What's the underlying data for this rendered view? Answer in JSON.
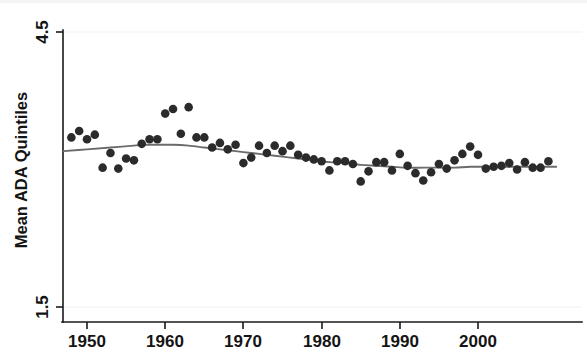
{
  "chart_data": {
    "type": "scatter",
    "title": "",
    "subtitle": "",
    "xlabel": "",
    "ylabel": "Mean ADA Quintiles",
    "xlim": [
      1947,
      2010
    ],
    "ylim": [
      1.5,
      4.5
    ],
    "xticks": [
      1950,
      1960,
      1970,
      1980,
      1990,
      2000
    ],
    "xtick_labels": [
      "1950",
      "1960",
      "1970",
      "1980",
      "1990",
      "2000"
    ],
    "yticks": [
      1.5,
      4.5
    ],
    "ytick_labels": [
      "1.5",
      "4.5"
    ],
    "grid": false,
    "legend": null,
    "annotations": [],
    "marker_color": "#2b2b2b",
    "fit_line_color": "#6b6b6b",
    "axis_color": "#1a1a1a",
    "background_color": "#ffffff",
    "series": [
      {
        "name": "Mean ADA Quintiles",
        "type": "scatter",
        "x": [
          1948,
          1949,
          1950,
          1951,
          1952,
          1953,
          1954,
          1955,
          1956,
          1957,
          1958,
          1959,
          1960,
          1961,
          1962,
          1963,
          1964,
          1965,
          1966,
          1967,
          1968,
          1969,
          1970,
          1971,
          1972,
          1973,
          1974,
          1975,
          1976,
          1977,
          1978,
          1979,
          1980,
          1981,
          1982,
          1983,
          1984,
          1985,
          1986,
          1987,
          1988,
          1989,
          1990,
          1991,
          1992,
          1993,
          1994,
          1995,
          1996,
          1997,
          1998,
          1999,
          2000,
          2001,
          2002,
          2003,
          2004,
          2005,
          2006,
          2007,
          2008,
          2009
        ],
        "y": [
          3.35,
          3.42,
          3.33,
          3.38,
          3.02,
          3.18,
          3.01,
          3.12,
          3.1,
          3.28,
          3.33,
          3.33,
          3.61,
          3.66,
          3.39,
          3.68,
          3.35,
          3.35,
          3.24,
          3.29,
          3.22,
          3.27,
          3.07,
          3.13,
          3.26,
          3.18,
          3.26,
          3.2,
          3.26,
          3.16,
          3.13,
          3.11,
          3.09,
          2.99,
          3.09,
          3.09,
          3.06,
          2.87,
          2.98,
          3.08,
          3.08,
          2.99,
          3.17,
          3.04,
          2.96,
          2.88,
          2.97,
          3.06,
          3.01,
          3.1,
          3.17,
          3.25,
          3.16,
          3.01,
          3.03,
          3.04,
          3.07,
          3.0,
          3.08,
          3.02,
          3.02,
          3.09
        ]
      },
      {
        "name": "Smoothed fit (lowess)",
        "type": "line",
        "x": [
          1947,
          1950,
          1953,
          1956,
          1957,
          1959,
          1961,
          1963,
          1965,
          1967,
          1969,
          1971,
          1973,
          1975,
          1977,
          1979,
          1981,
          1983,
          1985,
          1987,
          1989,
          1991,
          1993,
          1995,
          1997,
          1999,
          2001,
          2003,
          2005,
          2007,
          2009,
          2010
        ],
        "y": [
          3.2,
          3.22,
          3.24,
          3.26,
          3.27,
          3.27,
          3.27,
          3.26,
          3.24,
          3.22,
          3.2,
          3.18,
          3.16,
          3.14,
          3.12,
          3.1,
          3.08,
          3.07,
          3.05,
          3.04,
          3.03,
          3.02,
          3.02,
          3.02,
          3.02,
          3.03,
          3.03,
          3.03,
          3.03,
          3.03,
          3.03,
          3.03
        ]
      }
    ]
  },
  "axes": {
    "y_axis_title": "Mean ADA Quintiles",
    "y_tick_top": "4.5",
    "y_tick_bottom": "1.5",
    "x_tick_1": "1950",
    "x_tick_2": "1960",
    "x_tick_3": "1970",
    "x_tick_4": "1980",
    "x_tick_5": "1990",
    "x_tick_6": "2000"
  }
}
